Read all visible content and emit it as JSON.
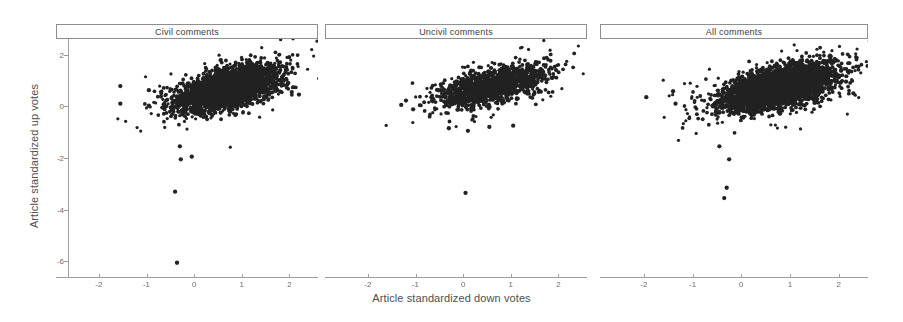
{
  "chart_data": {
    "type": "scatter",
    "title": "",
    "xlabel": "Article standardized down votes",
    "ylabel": "Article standardized up votes",
    "xlim": [
      -2.9,
      2.6
    ],
    "ylim": [
      -6.6,
      2.6
    ],
    "xticks": [
      -2,
      -1,
      0,
      1,
      2
    ],
    "xticklabels": [
      "-2",
      "-1",
      "0",
      "1",
      "2"
    ],
    "yticks": [
      2,
      0,
      -2,
      -4,
      -6
    ],
    "yticklabels": [
      "2",
      "0",
      "-2",
      "-4",
      "-6"
    ],
    "grid": false,
    "legend": null,
    "marker_color": "#222222",
    "marker_size": 1.9,
    "panels": [
      {
        "label": "Civil comments",
        "n_points": 2600,
        "cluster": {
          "x_mean": 0.72,
          "y_mean": 0.72,
          "x_sd": 0.52,
          "y_sd": 0.42,
          "correlation": 0.55
        },
        "outliers": [
          {
            "x": -1.55,
            "y": 0.78
          },
          {
            "x": -1.55,
            "y": 0.1
          },
          {
            "x": -0.95,
            "y": 0.62
          },
          {
            "x": -0.95,
            "y": 0.02
          },
          {
            "x": -0.3,
            "y": -1.55
          },
          {
            "x": -0.28,
            "y": -2.05
          },
          {
            "x": -0.05,
            "y": -1.95
          },
          {
            "x": -0.4,
            "y": -3.3
          },
          {
            "x": -0.36,
            "y": -6.05
          },
          {
            "x": 2.05,
            "y": 0.55
          },
          {
            "x": 2.2,
            "y": 0.45
          }
        ]
      },
      {
        "label": "Uncivil comments",
        "n_points": 1250,
        "cluster": {
          "x_mean": 0.62,
          "y_mean": 0.78,
          "x_sd": 0.55,
          "y_sd": 0.4,
          "correlation": 0.6
        },
        "outliers": [
          {
            "x": -1.2,
            "y": 0.22
          },
          {
            "x": -1.3,
            "y": 0.05
          },
          {
            "x": -1.05,
            "y": -0.12
          },
          {
            "x": -0.3,
            "y": -0.85
          },
          {
            "x": 0.1,
            "y": -0.95
          },
          {
            "x": 0.55,
            "y": -0.8
          },
          {
            "x": 1.05,
            "y": -0.75
          },
          {
            "x": 0.05,
            "y": -3.35
          },
          {
            "x": 1.95,
            "y": 1.4
          }
        ]
      },
      {
        "label": "All comments",
        "n_points": 3400,
        "cluster": {
          "x_mean": 0.78,
          "y_mean": 0.75,
          "x_sd": 0.55,
          "y_sd": 0.42,
          "correlation": 0.55
        },
        "outliers": [
          {
            "x": -1.95,
            "y": 0.35
          },
          {
            "x": -1.4,
            "y": 0.58
          },
          {
            "x": -1.35,
            "y": 0.1
          },
          {
            "x": -0.45,
            "y": -1.55
          },
          {
            "x": -0.25,
            "y": -2.05
          },
          {
            "x": -0.3,
            "y": -3.15
          },
          {
            "x": -0.35,
            "y": -3.55
          },
          {
            "x": 2.15,
            "y": 0.95
          },
          {
            "x": 2.3,
            "y": 0.5
          }
        ]
      }
    ]
  },
  "axes": {
    "ylabel": "Article standardized up votes",
    "xlabel": "Article standardized down votes",
    "yticklabels": [
      "2",
      "0",
      "-2",
      "-4",
      "-6"
    ],
    "xticklabels": [
      "-2",
      "-1",
      "0",
      "1",
      "2"
    ]
  },
  "panel_titles": {
    "p0": "Civil comments",
    "p1": "Uncivil comments",
    "p2": "All comments"
  }
}
